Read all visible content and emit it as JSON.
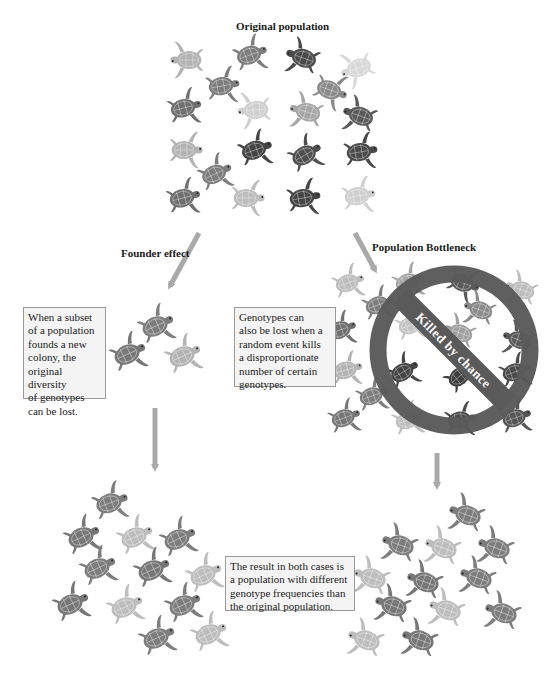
{
  "diagram": {
    "title": "Original population",
    "branches": {
      "founder": {
        "label": "Founder effect",
        "description_lines": [
          "When a subset",
          "of a population",
          "founds a new",
          "colony, the",
          "original diversity",
          "of genotypes",
          "can be lost."
        ]
      },
      "bottleneck": {
        "label": "Population Bottleneck",
        "description_lines": [
          "Genotypes can",
          "also be lost when a",
          "random event kills",
          "a disproportionate",
          "number of certain",
          "genotypes."
        ],
        "sign_label": "Killed by chance",
        "sign_icon": "prohibition-sign-icon"
      }
    },
    "result": {
      "description_lines": [
        "The result in both cases is",
        "a population with different",
        "genotype frequencies than",
        "the original population."
      ]
    },
    "colors": {
      "arrow": "#a9a9a9",
      "ban_sign": "#5a5a5a",
      "turtle_dark": "#4a4a4a",
      "turtle_mid": "#7d7d7d",
      "turtle_light": "#b3b3b3",
      "turtle_pale": "#cfcfcf",
      "box_bg": "#f4f4f4",
      "box_border": "#9a9a9a"
    },
    "icons": [
      "turtle-icon",
      "arrow-icon",
      "prohibition-sign-icon"
    ]
  }
}
